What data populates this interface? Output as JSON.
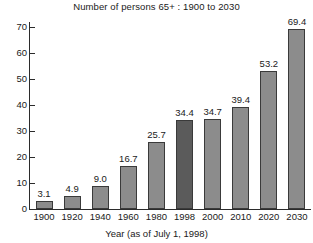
{
  "chart_data": {
    "type": "bar",
    "title": "Number of persons 65+ : 1900 to 2030",
    "xlabel": "Year (as of July 1, 1998)",
    "ylabel": "",
    "categories": [
      "1900",
      "1920",
      "1940",
      "1960",
      "1980",
      "1998",
      "2000",
      "2010",
      "2020",
      "2030"
    ],
    "values": [
      3.1,
      4.9,
      9.0,
      16.7,
      25.7,
      34.4,
      34.7,
      39.4,
      53.2,
      69.4
    ],
    "value_labels": [
      "3.1",
      "4.9",
      "9.0",
      "16.7",
      "25.7",
      "34.4",
      "34.7",
      "39.4",
      "53.2",
      "69.4"
    ],
    "highlight_index": 5,
    "ylim": [
      0,
      72
    ],
    "yticks": [
      0,
      10,
      20,
      30,
      40,
      50,
      60,
      70
    ],
    "ytick_labels": [
      "0",
      "10",
      "20",
      "30",
      "40",
      "50",
      "60",
      "70"
    ],
    "grid": false,
    "legend": null,
    "bar_color": "#8c8c8c",
    "highlight_color": "#5b5b5b",
    "bar_edge_color": "#3a3a3a",
    "axis_color": "#2b2b2b",
    "text_color": "#1a1a1a",
    "background": "#ffffff"
  }
}
